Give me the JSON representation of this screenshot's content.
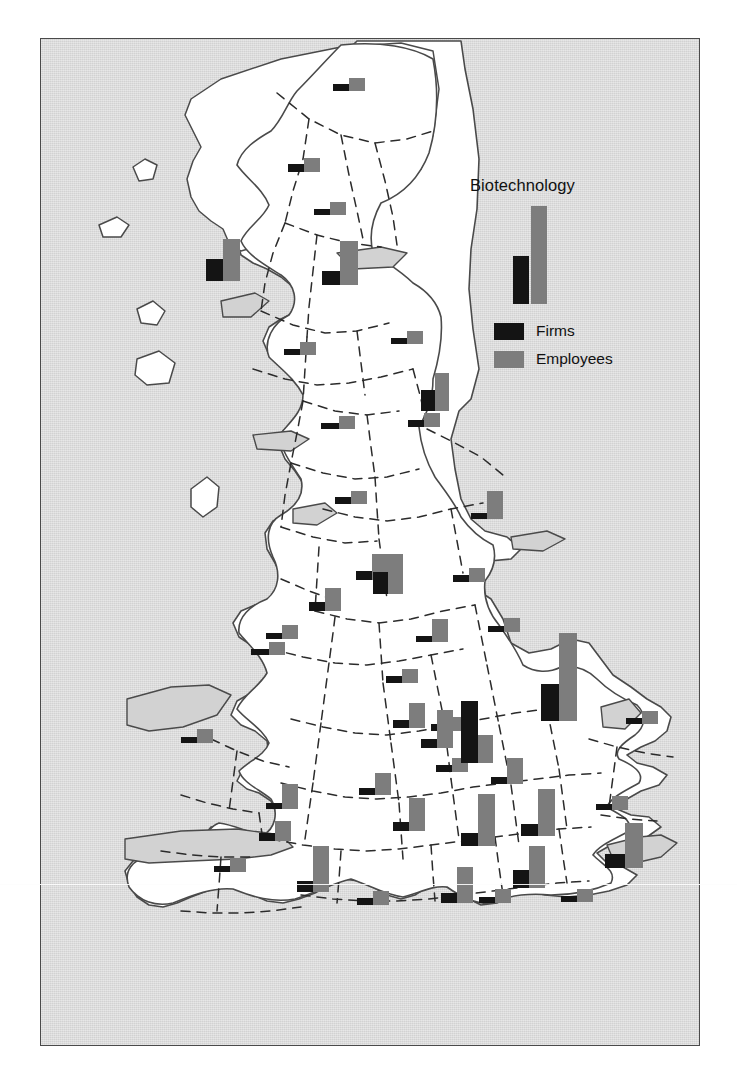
{
  "figure": {
    "title": "Biotechnology",
    "background_color": "#ffffff",
    "sea_color": "#d2d2d2",
    "land_color": "#ffffff",
    "coast_color": "#4a4a4a",
    "border_style": "dashed county boundaries"
  },
  "legend": {
    "title": "Biotechnology",
    "sample_bar": {
      "firms_height": 48,
      "employees_height": 98
    },
    "items": [
      {
        "label": "Firms",
        "color": "#141414"
      },
      {
        "label": "Employees",
        "color": "#7d7d7d"
      }
    ]
  },
  "chart_data": {
    "type": "bar",
    "title": "Biotechnology",
    "xlabel": "",
    "ylabel": "",
    "legend_position": "upper-right-inset",
    "grid": false,
    "series": [
      {
        "name": "Firms",
        "color": "#141414"
      },
      {
        "name": "Employees",
        "color": "#7d7d7d"
      }
    ],
    "categories": [
      "Grampian",
      "Tayside",
      "Fife",
      "Lothian",
      "Strathclyde",
      "Borders",
      "Cumbria",
      "Northumberland",
      "Tyne and Wear",
      "North Yorkshire",
      "Humberside",
      "Lancashire",
      "West Yorkshire",
      "Merseyside",
      "Greater Manchester",
      "South Yorkshire",
      "Cheshire",
      "Derbyshire",
      "Nottinghamshire",
      "Lincolnshire",
      "Gwynedd",
      "Clwyd",
      "Staffordshire",
      "Leicestershire",
      "Norfolk",
      "Dyfed",
      "West Midlands",
      "Warwickshire",
      "Northamptonshire",
      "Cambridgeshire",
      "Suffolk",
      "Hereford and Worcester",
      "Gloucestershire",
      "Oxfordshire",
      "Bedfordshire",
      "Essex",
      "Gwent",
      "South Glamorgan",
      "Avon",
      "Wiltshire",
      "Berkshire",
      "Greater London",
      "Kent",
      "Dorset",
      "Hampshire",
      "Surrey",
      "East Sussex"
    ],
    "values": {
      "Firms": [
        7,
        8,
        6,
        14,
        22,
        5,
        6,
        6,
        21,
        6,
        7,
        7,
        9,
        6,
        22,
        7,
        9,
        6,
        6,
        7,
        6,
        7,
        8,
        7,
        6,
        6,
        9,
        7,
        7,
        62,
        37,
        7,
        9,
        13,
        12,
        6,
        6,
        8,
        11,
        6,
        10,
        18,
        14,
        7,
        6,
        6,
        6
      ],
      "Employees": [
        13,
        14,
        13,
        44,
        42,
        13,
        13,
        13,
        38,
        13,
        14,
        13,
        26,
        14,
        40,
        14,
        23,
        23,
        14,
        28,
        13,
        14,
        25,
        14,
        13,
        14,
        38,
        14,
        26,
        28,
        88,
        22,
        33,
        52,
        47,
        14,
        25,
        20,
        46,
        14,
        36,
        42,
        45,
        14,
        14,
        14,
        13
      ]
    }
  },
  "markers": [
    {
      "name": "grampian",
      "x": 332,
      "y": 77,
      "firms": 7,
      "emp": 13,
      "fw": 16,
      "ew": 16
    },
    {
      "name": "tayside",
      "x": 287,
      "y": 157,
      "firms": 8,
      "emp": 14,
      "fw": 16,
      "ew": 16
    },
    {
      "name": "fife",
      "x": 313,
      "y": 201,
      "firms": 6,
      "emp": 13,
      "fw": 16,
      "ew": 16
    },
    {
      "name": "lothian",
      "x": 321,
      "y": 240,
      "firms": 14,
      "emp": 44,
      "fw": 18,
      "ew": 18
    },
    {
      "name": "strathclyde",
      "x": 205,
      "y": 238,
      "firms": 22,
      "emp": 42,
      "fw": 17,
      "ew": 17
    },
    {
      "name": "borders",
      "x": 283,
      "y": 341,
      "firms": 6,
      "emp": 13,
      "fw": 16,
      "ew": 16
    },
    {
      "name": "northumberland",
      "x": 390,
      "y": 330,
      "firms": 6,
      "emp": 13,
      "fw": 16,
      "ew": 16
    },
    {
      "name": "tyne-and-wear",
      "x": 420,
      "y": 372,
      "firms": 21,
      "emp": 38,
      "fw": 14,
      "ew": 14
    },
    {
      "name": "cumbria",
      "x": 320,
      "y": 415,
      "firms": 6,
      "emp": 13,
      "fw": 18,
      "ew": 16
    },
    {
      "name": "north-yorkshire",
      "x": 407,
      "y": 412,
      "firms": 7,
      "emp": 14,
      "fw": 16,
      "ew": 16
    },
    {
      "name": "humberside",
      "x": 470,
      "y": 490,
      "firms": 6,
      "emp": 28,
      "fw": 16,
      "ew": 16
    },
    {
      "name": "lancashire",
      "x": 334,
      "y": 490,
      "firms": 7,
      "emp": 13,
      "fw": 16,
      "ew": 16
    },
    {
      "name": "west-yorkshire",
      "x": 355,
      "y": 553,
      "firms": 9,
      "emp": 26,
      "fw": 16,
      "ew": 16
    },
    {
      "name": "merseyside",
      "x": 265,
      "y": 624,
      "firms": 6,
      "emp": 14,
      "fw": 16,
      "ew": 16
    },
    {
      "name": "greater-manchester",
      "x": 372,
      "y": 553,
      "firms": 22,
      "emp": 40,
      "fw": 15,
      "ew": 15
    },
    {
      "name": "south-yorkshire",
      "x": 452,
      "y": 567,
      "firms": 7,
      "emp": 14,
      "fw": 16,
      "ew": 16
    },
    {
      "name": "cheshire",
      "x": 308,
      "y": 587,
      "firms": 9,
      "emp": 23,
      "fw": 16,
      "ew": 16
    },
    {
      "name": "derbyshire",
      "x": 415,
      "y": 618,
      "firms": 6,
      "emp": 23,
      "fw": 16,
      "ew": 16
    },
    {
      "name": "nottinghamshire",
      "x": 487,
      "y": 617,
      "firms": 6,
      "emp": 14,
      "fw": 16,
      "ew": 16
    },
    {
      "name": "gwynedd",
      "x": 250,
      "y": 641,
      "firms": 6,
      "emp": 13,
      "fw": 18,
      "ew": 16
    },
    {
      "name": "clwyd",
      "x": 385,
      "y": 668,
      "firms": 7,
      "emp": 14,
      "fw": 16,
      "ew": 16
    },
    {
      "name": "staffordshire",
      "x": 392,
      "y": 702,
      "firms": 8,
      "emp": 25,
      "fw": 16,
      "ew": 16
    },
    {
      "name": "leicestershire",
      "x": 430,
      "y": 716,
      "firms": 7,
      "emp": 14,
      "fw": 16,
      "ew": 16
    },
    {
      "name": "lincolnshire",
      "x": 540,
      "y": 632,
      "firms": 37,
      "emp": 88,
      "fw": 18,
      "ew": 18
    },
    {
      "name": "norfolk",
      "x": 625,
      "y": 710,
      "firms": 6,
      "emp": 13,
      "fw": 16,
      "ew": 16
    },
    {
      "name": "dyfed",
      "x": 180,
      "y": 728,
      "firms": 6,
      "emp": 14,
      "fw": 16,
      "ew": 16
    },
    {
      "name": "west-midlands",
      "x": 420,
      "y": 709,
      "firms": 9,
      "emp": 38,
      "fw": 16,
      "ew": 16
    },
    {
      "name": "warwickshire",
      "x": 435,
      "y": 757,
      "firms": 7,
      "emp": 14,
      "fw": 16,
      "ew": 16
    },
    {
      "name": "northamptonshire",
      "x": 490,
      "y": 757,
      "firms": 7,
      "emp": 26,
      "fw": 16,
      "ew": 16
    },
    {
      "name": "cambridgeshire",
      "x": 460,
      "y": 700,
      "firms": 62,
      "emp": 28,
      "fw": 17,
      "ew": 15
    },
    {
      "name": "hereford-worcester",
      "x": 358,
      "y": 772,
      "firms": 7,
      "emp": 22,
      "fw": 16,
      "ew": 16
    },
    {
      "name": "gloucestershire",
      "x": 392,
      "y": 797,
      "firms": 9,
      "emp": 33,
      "fw": 16,
      "ew": 16
    },
    {
      "name": "oxfordshire",
      "x": 460,
      "y": 793,
      "firms": 13,
      "emp": 52,
      "fw": 17,
      "ew": 17
    },
    {
      "name": "bedfordshire",
      "x": 520,
      "y": 788,
      "firms": 12,
      "emp": 47,
      "fw": 17,
      "ew": 17
    },
    {
      "name": "essex",
      "x": 595,
      "y": 795,
      "firms": 6,
      "emp": 14,
      "fw": 16,
      "ew": 16
    },
    {
      "name": "gwent",
      "x": 265,
      "y": 783,
      "firms": 6,
      "emp": 25,
      "fw": 16,
      "ew": 16
    },
    {
      "name": "south-glamorgan",
      "x": 258,
      "y": 820,
      "firms": 8,
      "emp": 20,
      "fw": 16,
      "ew": 16
    },
    {
      "name": "avon",
      "x": 296,
      "y": 845,
      "firms": 11,
      "emp": 46,
      "fw": 16,
      "ew": 16
    },
    {
      "name": "wiltshire",
      "x": 213,
      "y": 857,
      "firms": 6,
      "emp": 14,
      "fw": 16,
      "ew": 16
    },
    {
      "name": "berkshire",
      "x": 440,
      "y": 866,
      "firms": 10,
      "emp": 36,
      "fw": 16,
      "ew": 16
    },
    {
      "name": "greater-london",
      "x": 512,
      "y": 845,
      "firms": 18,
      "emp": 42,
      "fw": 16,
      "ew": 16
    },
    {
      "name": "kent",
      "x": 604,
      "y": 822,
      "firms": 14,
      "emp": 45,
      "fw": 20,
      "ew": 18
    },
    {
      "name": "dorset",
      "x": 356,
      "y": 890,
      "firms": 7,
      "emp": 14,
      "fw": 16,
      "ew": 16
    },
    {
      "name": "hampshire",
      "x": 478,
      "y": 888,
      "firms": 6,
      "emp": 14,
      "fw": 16,
      "ew": 16
    },
    {
      "name": "east-sussex",
      "x": 560,
      "y": 888,
      "firms": 6,
      "emp": 13,
      "fw": 16,
      "ew": 16
    }
  ]
}
